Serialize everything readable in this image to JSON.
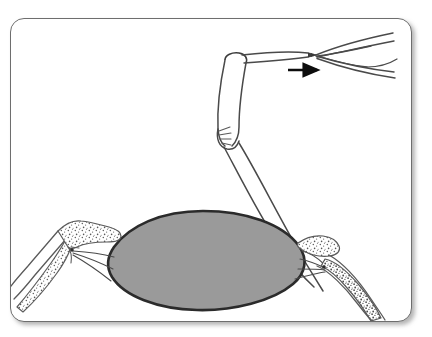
{
  "figure": {
    "domain_label": "Diagram",
    "title": "",
    "caption": "",
    "frame": {
      "border_color": "#6e6e6e",
      "background_color": "#ffffff",
      "corner_radius_px": 14,
      "shadow_color": "#9a9a9a"
    },
    "palette": {
      "outline": "#3a3a3a",
      "ink_light": "#5a5a5a",
      "body_fill": "#9a9a9a",
      "body_outline": "#2b2b2b",
      "stipple": "#6a6a6a",
      "arrow": "#0d0d0d",
      "page_background": "#ffffff"
    },
    "annotations": {
      "direction_arrow": {
        "name": "direction-arrow",
        "label": "",
        "points": "right",
        "color": "#0d0d0d"
      }
    },
    "parts": [
      {
        "id": "central-body",
        "label": "",
        "shape": "filled-ellipse",
        "fill": "#9a9a9a",
        "outline": "#2b2b2b",
        "position": "center-lower"
      },
      {
        "id": "left-stippled-appendage",
        "label": "",
        "shape": "stippled-limb",
        "fill": "#ffffff",
        "texture": "stipple",
        "position": "lower-left"
      },
      {
        "id": "right-stippled-appendage",
        "label": "",
        "shape": "stippled-limb",
        "fill": "#ffffff",
        "texture": "stipple",
        "position": "lower-right"
      },
      {
        "id": "bent-tubular-limb",
        "label": "",
        "shape": "bent-outline-tube",
        "fill": "#ffffff",
        "position": "upper-right"
      },
      {
        "id": "forked-tip",
        "label": "",
        "shape": "y-fork",
        "fill": "#ffffff",
        "position": "top-right"
      },
      {
        "id": "left-connective-fibers",
        "label": "",
        "shape": "fan-lines",
        "position": "center-left"
      },
      {
        "id": "right-connective-fibers",
        "label": "",
        "shape": "fan-lines",
        "position": "center-right"
      },
      {
        "id": "elbow-striations",
        "label": "",
        "shape": "radiating-lines",
        "position": "mid-right"
      }
    ]
  }
}
